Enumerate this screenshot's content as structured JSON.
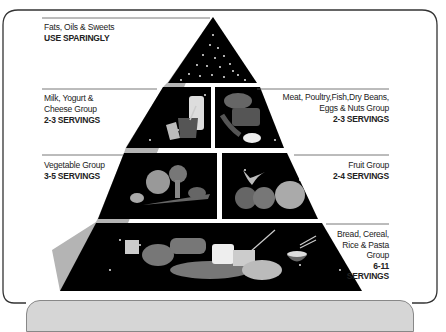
{
  "tiers": [
    {
      "id": "fats",
      "group": "Fats, Oils & Sweets",
      "servings": "USE SPARINGLY",
      "side": "left"
    },
    {
      "id": "milk",
      "group_line1": "Milk, Yogurt &",
      "group_line2": "Cheese Group",
      "servings": "2-3 SERVINGS",
      "side": "left"
    },
    {
      "id": "meat",
      "group_line1": "Meat, Poultry,Fish,Dry Beans,",
      "group_line2": "Eggs & Nuts Group",
      "servings": "2-3 SERVINGS",
      "side": "right"
    },
    {
      "id": "vegetable",
      "group": "Vegetable Group",
      "servings": "3-5 SERVINGS",
      "side": "left"
    },
    {
      "id": "fruit",
      "group": "Fruit Group",
      "servings": "2-4 SERVINGS",
      "side": "right"
    },
    {
      "id": "bread",
      "group_line1": "Bread, Cereal,",
      "group_line2": "Rice & Pasta",
      "group_line3": "Group",
      "servings_line1": "6-11",
      "servings_line2": "SERVINGS",
      "side": "right"
    }
  ],
  "colors": {
    "tier_fill": "#000000",
    "side_face": "#b4b4b4",
    "frame": "#333333",
    "panel": "#d6d6d6"
  }
}
